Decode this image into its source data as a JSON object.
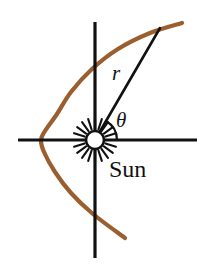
{
  "figure": {
    "kind": "orbit-diagram",
    "width": 213,
    "height": 270,
    "background": "#ffffff"
  },
  "colors": {
    "orbit_curve": "#9B5F2F",
    "orbit_curve_light": "#A8703F",
    "axis": "#111111",
    "radius_line": "#111111",
    "sun_outline": "#111111",
    "sun_fill": "#ffffff",
    "text": "#111111"
  },
  "labels": {
    "radius": "r",
    "angle": "θ",
    "body": "Sun"
  },
  "chart_data": {
    "type": "line",
    "coordinate_system": "polar",
    "xlabel": "",
    "ylabel": "",
    "grid": false,
    "legend": false,
    "focus_label": "Sun",
    "focus_point": [
      95,
      140
    ],
    "axes": {
      "horizontal": {
        "y": 140,
        "x_start": 18,
        "x_end": 197
      },
      "vertical": {
        "x": 95,
        "y_start": 22,
        "y_end": 258
      }
    },
    "curve": {
      "name": "parabolic orbit",
      "color": "#9B5F2F",
      "vertex": [
        41,
        140
      ],
      "opens": "right",
      "points": [
        [
          182,
          23
        ],
        [
          150,
          33
        ],
        [
          118,
          49
        ],
        [
          92,
          69
        ],
        [
          71,
          92
        ],
        [
          57,
          114
        ],
        [
          45,
          131
        ],
        [
          41,
          140
        ],
        [
          44,
          152
        ],
        [
          55,
          172
        ],
        [
          71,
          193
        ],
        [
          93,
          214
        ],
        [
          125,
          238
        ]
      ]
    },
    "radius_vector": {
      "label": "r",
      "from": [
        95,
        140
      ],
      "to": [
        160,
        28
      ],
      "angle_deg_from_positive_x_axis": 60
    },
    "angle_arc": {
      "label": "θ",
      "center": [
        95,
        140
      ],
      "radius_px": 22,
      "start_deg": 0,
      "end_deg": 60
    },
    "sun_glyph": {
      "center": [
        95,
        140
      ],
      "disc_radius_px": 9,
      "ray_inner_radius_px": 11,
      "ray_outer_radius_px": 22,
      "ray_count": 20
    }
  }
}
